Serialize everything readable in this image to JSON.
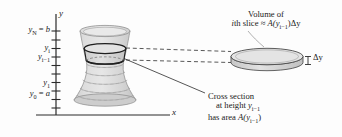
{
  "figure": {
    "name": "volume-by-slicing-diagram",
    "axes": {
      "y_axis_label": "y",
      "x_axis_label": "x",
      "tick_labels": [
        {
          "id": "yN",
          "text": "y",
          "sub": "N",
          "eq": " = ",
          "value": "b"
        },
        {
          "id": "yi",
          "text": "y",
          "sub": "i",
          "eq": "",
          "value": ""
        },
        {
          "id": "yi1",
          "text": "y",
          "sub": "i−1",
          "eq": "",
          "value": ""
        },
        {
          "id": "y1",
          "text": "y",
          "sub": "1",
          "eq": "",
          "value": ""
        },
        {
          "id": "y0",
          "text": "y",
          "sub": "0",
          "eq": " = ",
          "value": "a"
        }
      ],
      "tick_count": 10
    },
    "annotations": {
      "volume_line1": "Volume of",
      "volume_line2_pre": "th slice ≈ ",
      "volume_line2_i": "i",
      "volume_line2_post": "A(y",
      "volume_line2_sub": "i−1",
      "volume_line2_tail": ")Δy",
      "delta_y": "Δy",
      "cross_line1": "Cross section",
      "cross_line2_pre": "at height ",
      "cross_line2_y": "y",
      "cross_line2_sub": "i−1",
      "cross_line3_pre": "has area ",
      "cross_line3_A": "A(y",
      "cross_line3_sub": "i−1",
      "cross_line3_tail": ")"
    },
    "colors": {
      "solid_fill": "#d6d6d6",
      "solid_fill_light": "#e4e4e4",
      "outline": "#6e6e6e",
      "highlight_outline": "#1f1f1f",
      "axis": "#2b2b2b",
      "text": "#1a1a1a",
      "leader": "#3a3a3a",
      "background": "#fdfdfd"
    }
  }
}
